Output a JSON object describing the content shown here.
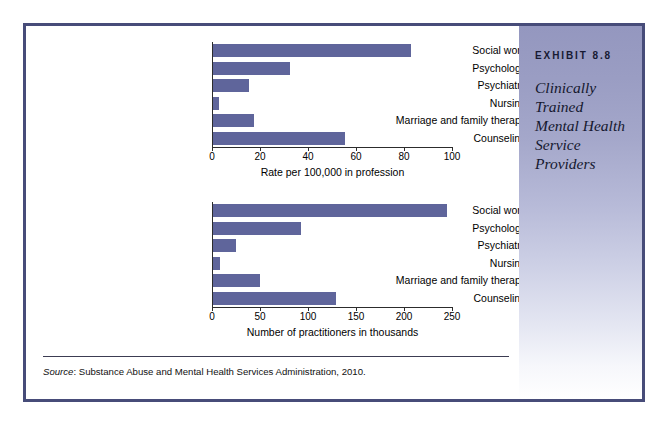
{
  "exhibit": {
    "number_label": "EXHIBIT 8.8",
    "title_lines": [
      "Clinically",
      "Trained",
      "Mental Health",
      "Service",
      "Providers"
    ],
    "title_full": "Clinically Trained Mental Health Service Providers",
    "border_color": "#474c79",
    "bar_color": "#5f659b",
    "sidebar_top_color": "#9497bf",
    "sidebar_bottom_color": "#ffffff"
  },
  "source": {
    "keyword": "Source",
    "text": ": Substance Abuse and Mental Health Services Administration, 2010."
  },
  "chart_data": [
    {
      "type": "bar",
      "orientation": "horizontal",
      "title": "",
      "categories": [
        "Social work",
        "Psychology",
        "Psychiatry",
        "Nursing",
        "Marriage and family therapy",
        "Counseling"
      ],
      "values": [
        82.5,
        32,
        15,
        2.5,
        17,
        55
      ],
      "xlabel": "Rate per 100,000 in profession",
      "ylabel": "",
      "xlim": [
        0,
        100
      ],
      "xticks": [
        0,
        20,
        40,
        60,
        80,
        100
      ],
      "xtick_labels": [
        "0",
        "20",
        "40",
        "60",
        "80",
        "100"
      ],
      "grid": false,
      "legend": false
    },
    {
      "type": "bar",
      "orientation": "horizontal",
      "title": "",
      "categories": [
        "Social work",
        "Psychology",
        "Psychiatry",
        "Nursing",
        "Marriage and family therapy",
        "Counseling"
      ],
      "values": [
        244,
        92,
        24,
        7,
        49,
        128
      ],
      "xlabel": "Number of practitioners in thousands",
      "ylabel": "",
      "xlim": [
        0,
        250
      ],
      "xticks": [
        0,
        50,
        100,
        150,
        200,
        250
      ],
      "xtick_labels": [
        "0",
        "50",
        "100",
        "150",
        "200",
        "250"
      ],
      "grid": false,
      "legend": false
    }
  ]
}
